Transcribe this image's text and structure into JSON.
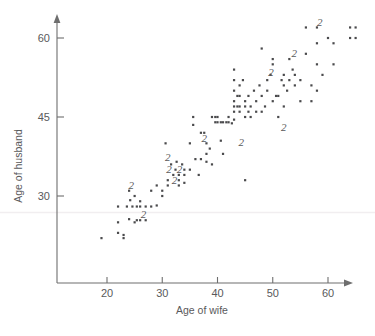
{
  "chart_data": {
    "type": "scatter",
    "title": "",
    "xlabel": "Age of wife",
    "ylabel": "Age of husband",
    "xlim": [
      14,
      66
    ],
    "ylim": [
      18,
      64
    ],
    "xticks": [
      20,
      30,
      40,
      50,
      60
    ],
    "yticks": [
      30,
      45,
      60
    ],
    "grid": false,
    "legend": null,
    "note": "Points marked with the digit 2 indicate two coincident observations at that location.",
    "points": [
      [
        19,
        22
      ],
      [
        22,
        23
      ],
      [
        23,
        22
      ],
      [
        23,
        22.6
      ],
      [
        22,
        25
      ],
      [
        24,
        25.6
      ],
      [
        25,
        25
      ],
      [
        25.4,
        25.4
      ],
      [
        26,
        25.4
      ],
      [
        27,
        25.4
      ],
      [
        22,
        28
      ],
      [
        23.6,
        28
      ],
      [
        24.2,
        29.2
      ],
      [
        24.6,
        28
      ],
      [
        25.4,
        28
      ],
      [
        26,
        28
      ],
      [
        26,
        29
      ],
      [
        27,
        28
      ],
      [
        25,
        30
      ],
      [
        24,
        31
      ],
      [
        28,
        28
      ],
      [
        28,
        31
      ],
      [
        29,
        32
      ],
      [
        29,
        28.2
      ],
      [
        30,
        31
      ],
      [
        30,
        30
      ],
      [
        31,
        32
      ],
      [
        30.6,
        40
      ],
      [
        31,
        33
      ],
      [
        31.6,
        36
      ],
      [
        32,
        34
      ],
      [
        32.4,
        35
      ],
      [
        32.6,
        36.5
      ],
      [
        33,
        33
      ],
      [
        33,
        32
      ],
      [
        33,
        34
      ],
      [
        33.6,
        36
      ],
      [
        34,
        34
      ],
      [
        34,
        35
      ],
      [
        34,
        32.5
      ],
      [
        35,
        35
      ],
      [
        35,
        40
      ],
      [
        35.6,
        45
      ],
      [
        35.6,
        43.5
      ],
      [
        36,
        37
      ],
      [
        36.6,
        34
      ],
      [
        37,
        37
      ],
      [
        37,
        42
      ],
      [
        37.6,
        42
      ],
      [
        38,
        38
      ],
      [
        38,
        36.5
      ],
      [
        38,
        40
      ],
      [
        38.6,
        39
      ],
      [
        39,
        36
      ],
      [
        39,
        45
      ],
      [
        39.6,
        45
      ],
      [
        39.6,
        44
      ],
      [
        40,
        44
      ],
      [
        40,
        45
      ],
      [
        40.6,
        44
      ],
      [
        40.6,
        40.5
      ],
      [
        41,
        44
      ],
      [
        41,
        38
      ],
      [
        41.6,
        44
      ],
      [
        42,
        44
      ],
      [
        42,
        45
      ],
      [
        42.6,
        43.8
      ],
      [
        43,
        44.5
      ],
      [
        43,
        46
      ],
      [
        43,
        47
      ],
      [
        43,
        48
      ],
      [
        43,
        50
      ],
      [
        43,
        52
      ],
      [
        43,
        54
      ],
      [
        43.6,
        47
      ],
      [
        43.6,
        49
      ],
      [
        44,
        47
      ],
      [
        44,
        49
      ],
      [
        44,
        51
      ],
      [
        44,
        46
      ],
      [
        44.6,
        52
      ],
      [
        45,
        33
      ],
      [
        45,
        45
      ],
      [
        45,
        47
      ],
      [
        45,
        48
      ],
      [
        45.6,
        46
      ],
      [
        45.6,
        49
      ],
      [
        46,
        45
      ],
      [
        46,
        47
      ],
      [
        46.6,
        50
      ],
      [
        47,
        46
      ],
      [
        47,
        48
      ],
      [
        47.6,
        51
      ],
      [
        48,
        46
      ],
      [
        48,
        49
      ],
      [
        48,
        58
      ],
      [
        48.6,
        47
      ],
      [
        49,
        52
      ],
      [
        49,
        50
      ],
      [
        49.6,
        53
      ],
      [
        50,
        48
      ],
      [
        50,
        55
      ],
      [
        50,
        56
      ],
      [
        50.6,
        49
      ],
      [
        51,
        45
      ],
      [
        51,
        49
      ],
      [
        51.6,
        52
      ],
      [
        52,
        47
      ],
      [
        52,
        51
      ],
      [
        52,
        53
      ],
      [
        52.6,
        50
      ],
      [
        53,
        52
      ],
      [
        53,
        56
      ],
      [
        53.6,
        54
      ],
      [
        54,
        51
      ],
      [
        54,
        53
      ],
      [
        55,
        52
      ],
      [
        55,
        48
      ],
      [
        56,
        57
      ],
      [
        56,
        62
      ],
      [
        57,
        51
      ],
      [
        57,
        48
      ],
      [
        58,
        59
      ],
      [
        58,
        62
      ],
      [
        58,
        55
      ],
      [
        58,
        50
      ],
      [
        59,
        53
      ],
      [
        60,
        60
      ],
      [
        61,
        55
      ],
      [
        61,
        59
      ],
      [
        64,
        62
      ],
      [
        64,
        60
      ],
      [
        65,
        60
      ],
      [
        65,
        62
      ]
    ],
    "overlap_labels": [
      {
        "text": "2",
        "x": 24.4,
        "y": 31.3
      },
      {
        "text": "2",
        "x": 26.6,
        "y": 25.8
      },
      {
        "text": "2",
        "x": 31.0,
        "y": 36.6
      },
      {
        "text": "2",
        "x": 31.2,
        "y": 34.3
      },
      {
        "text": "2",
        "x": 33.1,
        "y": 34.3
      },
      {
        "text": "2",
        "x": 32.2,
        "y": 32.2
      },
      {
        "text": "2",
        "x": 37.6,
        "y": 40.2
      },
      {
        "text": "2",
        "x": 44.3,
        "y": 39.5
      },
      {
        "text": "2",
        "x": 49.7,
        "y": 52.8
      },
      {
        "text": "2",
        "x": 52.0,
        "y": 42.4
      },
      {
        "text": "2",
        "x": 53.9,
        "y": 56.3
      },
      {
        "text": "2",
        "x": 58.5,
        "y": 62.2
      }
    ]
  },
  "axes": {
    "x_title": "Age of wife",
    "y_title": "Age of husband",
    "x_tick_labels": [
      "20",
      "30",
      "40",
      "50",
      "60"
    ],
    "y_tick_labels": [
      "30",
      "45",
      "60"
    ]
  },
  "colors": {
    "point": "#4a4a4c",
    "axis": "#6e6e6e",
    "text": "#59595b",
    "background": "#ffffff",
    "artifact_line": "#f1eef0"
  }
}
